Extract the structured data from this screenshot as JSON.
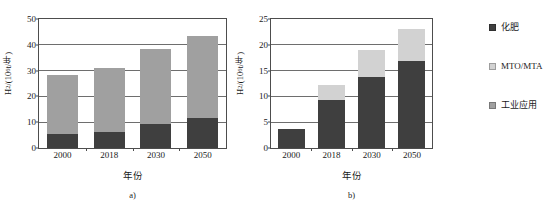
{
  "figure": {
    "background": "#ffffff",
    "colors": {
      "fertilizer": "#3f3f3f",
      "mto_mta": "#d2d2d2",
      "industrial": "#a0a0a0",
      "axis": "#4d4d4d",
      "grid": "#6e6e6e",
      "text": "#1a1a1a"
    }
  },
  "legend": {
    "position": "right",
    "items": [
      {
        "label": "化肥",
        "color": "#3f3f3f",
        "key": "fertilizer"
      },
      {
        "label": "MTO/MTA",
        "color": "#d2d2d2",
        "key": "mto_mta"
      },
      {
        "label": "工业应用",
        "color": "#a0a0a0",
        "key": "industrial"
      }
    ]
  },
  "panels": [
    {
      "id": "a",
      "caption": "a)",
      "xlabel": "年份",
      "ylabel_parts": {
        "prefix": "H",
        "sub": "2",
        "mid": "/(10",
        "sup": "6",
        "suffix": "t/年)"
      },
      "ylabel_text": "H2/(10^6 t/年)"
    },
    {
      "id": "b",
      "caption": "b)",
      "xlabel": "年份",
      "ylabel_parts": {
        "prefix": "H",
        "sub": "2",
        "mid": "/(10",
        "sup": "6",
        "suffix": "t/年)"
      },
      "ylabel_text": "H2/(10^6 t/年)"
    }
  ],
  "chart_data": [
    {
      "panel": "a",
      "type": "bar",
      "stacked": true,
      "title": "",
      "subtitle": "a)",
      "xlabel": "年份",
      "ylabel": "H2/(10^6 t/年)",
      "categories": [
        "2000",
        "2018",
        "2030",
        "2050"
      ],
      "ylim": [
        0,
        50
      ],
      "yticks": [
        0,
        10,
        20,
        30,
        40,
        50
      ],
      "grid": true,
      "legend_position": "right",
      "series": [
        {
          "name": "化肥",
          "color": "#3f3f3f",
          "values": [
            5.5,
            6.2,
            9.2,
            11.8
          ]
        },
        {
          "name": "工业应用",
          "color": "#a0a0a0",
          "values": [
            22.7,
            25.0,
            29.0,
            31.5
          ]
        }
      ],
      "totals": [
        28.2,
        31.2,
        38.2,
        43.3
      ]
    },
    {
      "panel": "b",
      "type": "bar",
      "stacked": true,
      "title": "",
      "subtitle": "b)",
      "xlabel": "年份",
      "ylabel": "H2/(10^6 t/年)",
      "categories": [
        "2000",
        "2018",
        "2030",
        "2050"
      ],
      "ylim": [
        0,
        25
      ],
      "yticks": [
        0,
        5,
        10,
        15,
        20,
        25
      ],
      "grid": true,
      "legend_position": "right",
      "series": [
        {
          "name": "化肥",
          "color": "#3f3f3f",
          "values": [
            3.6,
            9.3,
            13.8,
            16.8
          ]
        },
        {
          "name": "MTO/MTA",
          "color": "#d2d2d2",
          "values": [
            0.0,
            2.9,
            5.2,
            6.2
          ]
        }
      ],
      "totals": [
        3.6,
        12.2,
        19.0,
        23.0
      ]
    }
  ]
}
